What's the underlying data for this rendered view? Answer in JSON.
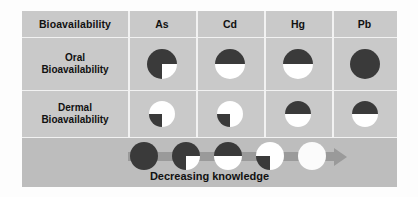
{
  "chart_data": {
    "type": "table",
    "corner_label": "Bioavailability",
    "categories": [
      "As",
      "Cd",
      "Hg",
      "Pb"
    ],
    "rows": [
      {
        "label": "Oral\nBioavailability",
        "label_line1": "Oral",
        "label_line2": "Bioavailability",
        "values": [
          75,
          50,
          50,
          100
        ],
        "glyphs": [
          "three-quarter-dark-pie",
          "half-dark-pie",
          "half-dark-pie",
          "full-dark-pie"
        ]
      },
      {
        "label": "Dermal\nBioavailability",
        "label_line1": "Dermal",
        "label_line2": "Bioavailability",
        "values": [
          25,
          25,
          50,
          50
        ],
        "glyphs": [
          "quarter-dark-pie",
          "quarter-dark-pie",
          "half-dark-pie",
          "half-dark-pie"
        ]
      }
    ],
    "legend": {
      "caption": "Decreasing knowledge",
      "scale_values": [
        100,
        75,
        50,
        25,
        0
      ],
      "glyphs": [
        "full-dark-pie",
        "three-quarter-dark-pie",
        "half-dark-pie",
        "quarter-dark-pie",
        "empty-pie"
      ],
      "arrow_direction": "right"
    },
    "colors": {
      "dark_fill": "#3a3a3a",
      "light_fill": "#ffffff",
      "table_background": "#c9c9c9",
      "legend_background": "#bdbdbd",
      "gridline": "#f2f2f2",
      "arrow": "#9a9a9a",
      "text": "#111111"
    }
  }
}
